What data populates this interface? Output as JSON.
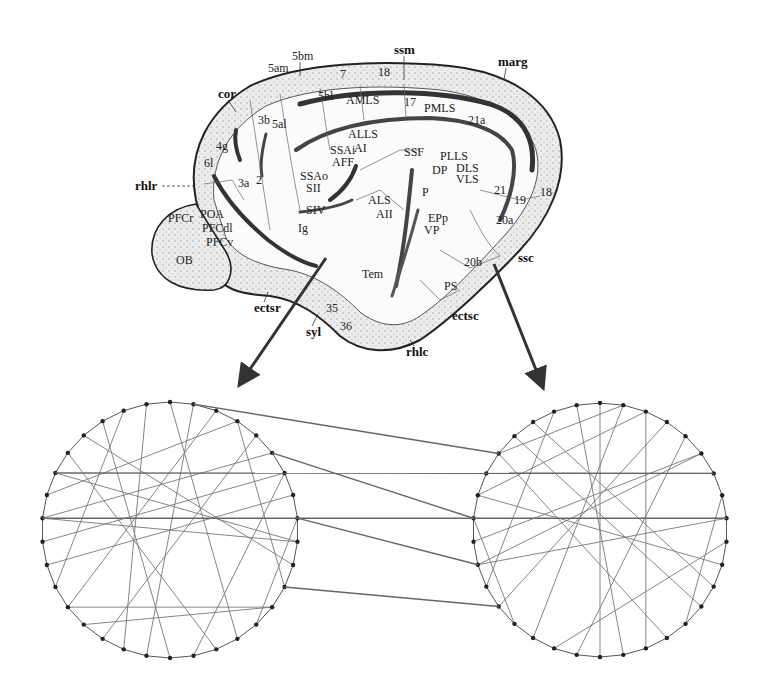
{
  "figure": {
    "sulcus_labels": [
      {
        "text": "cor",
        "x": 218,
        "y": 98
      },
      {
        "text": "5am",
        "x": 268,
        "y": 72
      },
      {
        "text": "5bm",
        "x": 292,
        "y": 60
      },
      {
        "text": "ssm",
        "x": 394,
        "y": 54
      },
      {
        "text": "marg",
        "x": 498,
        "y": 66
      },
      {
        "text": "rhlr",
        "x": 135,
        "y": 190
      },
      {
        "text": "ectsr",
        "x": 254,
        "y": 312
      },
      {
        "text": "syl",
        "x": 306,
        "y": 336
      },
      {
        "text": "rhlc",
        "x": 406,
        "y": 356
      },
      {
        "text": "ectsc",
        "x": 452,
        "y": 320
      },
      {
        "text": "ssc",
        "x": 518,
        "y": 262
      }
    ],
    "area_labels": [
      {
        "text": "7",
        "x": 340,
        "y": 78
      },
      {
        "text": "18",
        "x": 378,
        "y": 76
      },
      {
        "text": "5bl",
        "x": 318,
        "y": 100
      },
      {
        "text": "AMLS",
        "x": 346,
        "y": 104
      },
      {
        "text": "17",
        "x": 404,
        "y": 106
      },
      {
        "text": "PMLS",
        "x": 424,
        "y": 112
      },
      {
        "text": "21a",
        "x": 468,
        "y": 124
      },
      {
        "text": "4g",
        "x": 216,
        "y": 150
      },
      {
        "text": "3b",
        "x": 258,
        "y": 124
      },
      {
        "text": "5al",
        "x": 272,
        "y": 128
      },
      {
        "text": "ALLS",
        "x": 348,
        "y": 138
      },
      {
        "text": "AI",
        "x": 354,
        "y": 152
      },
      {
        "text": "SSAi",
        "x": 330,
        "y": 154
      },
      {
        "text": "AFF",
        "x": 332,
        "y": 166
      },
      {
        "text": "SSF",
        "x": 404,
        "y": 156
      },
      {
        "text": "PLLS",
        "x": 440,
        "y": 160
      },
      {
        "text": "DP",
        "x": 432,
        "y": 174
      },
      {
        "text": "DLS",
        "x": 456,
        "y": 172
      },
      {
        "text": "VLS",
        "x": 456,
        "y": 183
      },
      {
        "text": "6l",
        "x": 204,
        "y": 167
      },
      {
        "text": "3a",
        "x": 238,
        "y": 187
      },
      {
        "text": "2",
        "x": 256,
        "y": 184
      },
      {
        "text": "SSAo",
        "x": 300,
        "y": 180
      },
      {
        "text": "SII",
        "x": 306,
        "y": 192
      },
      {
        "text": "21",
        "x": 494,
        "y": 194
      },
      {
        "text": "19",
        "x": 514,
        "y": 204
      },
      {
        "text": "18",
        "x": 540,
        "y": 196
      },
      {
        "text": "ALS",
        "x": 368,
        "y": 204
      },
      {
        "text": "AII",
        "x": 376,
        "y": 218
      },
      {
        "text": "P",
        "x": 422,
        "y": 196
      },
      {
        "text": "SIV",
        "x": 306,
        "y": 214
      },
      {
        "text": "PFCr",
        "x": 168,
        "y": 222
      },
      {
        "text": "POA",
        "x": 200,
        "y": 218
      },
      {
        "text": "PFCdl",
        "x": 202,
        "y": 232
      },
      {
        "text": "PFCv",
        "x": 206,
        "y": 246
      },
      {
        "text": "Ig",
        "x": 298,
        "y": 232
      },
      {
        "text": "EPp",
        "x": 428,
        "y": 222
      },
      {
        "text": "VP",
        "x": 424,
        "y": 234
      },
      {
        "text": "20a",
        "x": 496,
        "y": 224
      },
      {
        "text": "OB",
        "x": 176,
        "y": 264
      },
      {
        "text": "Tem",
        "x": 362,
        "y": 278
      },
      {
        "text": "20b",
        "x": 464,
        "y": 266
      },
      {
        "text": "PS",
        "x": 444,
        "y": 290
      },
      {
        "text": "35",
        "x": 326,
        "y": 312
      },
      {
        "text": "36",
        "x": 340,
        "y": 330
      }
    ],
    "arrows": [
      {
        "name": "arrow-to-left-network",
        "from": [
          326,
          258
        ],
        "to": [
          240,
          384
        ]
      },
      {
        "name": "arrow-to-right-network",
        "from": [
          494,
          264
        ],
        "to": [
          542,
          386
        ]
      }
    ],
    "networks": [
      {
        "name": "left-network",
        "cx": 170,
        "cy": 530,
        "r": 128,
        "nodes": 34
      },
      {
        "name": "right-network",
        "cx": 600,
        "cy": 530,
        "r": 127,
        "nodes": 34
      }
    ]
  }
}
